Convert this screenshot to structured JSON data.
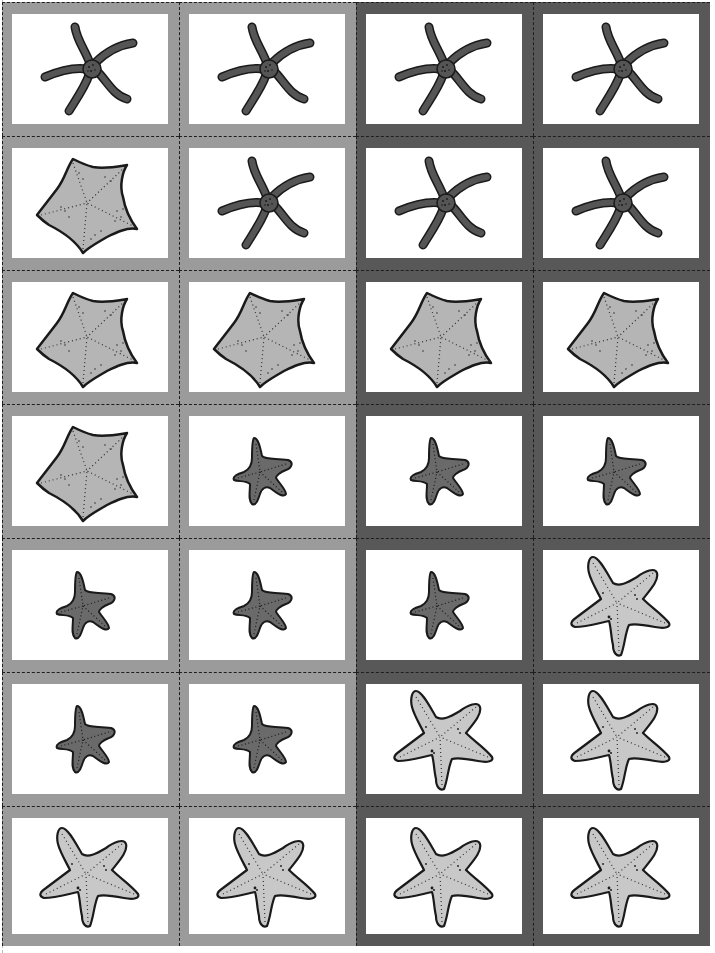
{
  "sheet": {
    "title": "Starfish matching cards",
    "columns": 4,
    "rows": 7,
    "colors": {
      "frame_light": "#9b9b9b",
      "frame_dark": "#585858",
      "card_bg": "#ffffff",
      "cut_line": "#1e1e1e",
      "brittle_fill": "#555555",
      "cushion_fill": "#b5b5b5",
      "small_fill": "#6a6a6a",
      "large_fill": "#c8c8c8"
    }
  },
  "cards": [
    {
      "row": 1,
      "col": 1,
      "frame": "light",
      "icon": "brittle-star-icon"
    },
    {
      "row": 1,
      "col": 2,
      "frame": "light",
      "icon": "brittle-star-icon"
    },
    {
      "row": 1,
      "col": 3,
      "frame": "dark",
      "icon": "brittle-star-icon"
    },
    {
      "row": 1,
      "col": 4,
      "frame": "dark",
      "icon": "brittle-star-icon"
    },
    {
      "row": 2,
      "col": 1,
      "frame": "light",
      "icon": "cushion-star-icon"
    },
    {
      "row": 2,
      "col": 2,
      "frame": "light",
      "icon": "brittle-star-icon"
    },
    {
      "row": 2,
      "col": 3,
      "frame": "dark",
      "icon": "brittle-star-icon"
    },
    {
      "row": 2,
      "col": 4,
      "frame": "dark",
      "icon": "brittle-star-icon"
    },
    {
      "row": 3,
      "col": 1,
      "frame": "light",
      "icon": "cushion-star-icon"
    },
    {
      "row": 3,
      "col": 2,
      "frame": "light",
      "icon": "cushion-star-icon"
    },
    {
      "row": 3,
      "col": 3,
      "frame": "dark",
      "icon": "cushion-star-icon"
    },
    {
      "row": 3,
      "col": 4,
      "frame": "dark",
      "icon": "cushion-star-icon"
    },
    {
      "row": 4,
      "col": 1,
      "frame": "light",
      "icon": "cushion-star-icon"
    },
    {
      "row": 4,
      "col": 2,
      "frame": "light",
      "icon": "small-starfish-icon"
    },
    {
      "row": 4,
      "col": 3,
      "frame": "dark",
      "icon": "small-starfish-icon"
    },
    {
      "row": 4,
      "col": 4,
      "frame": "dark",
      "icon": "small-starfish-icon"
    },
    {
      "row": 5,
      "col": 1,
      "frame": "light",
      "icon": "small-starfish-icon"
    },
    {
      "row": 5,
      "col": 2,
      "frame": "light",
      "icon": "small-starfish-icon"
    },
    {
      "row": 5,
      "col": 3,
      "frame": "dark",
      "icon": "small-starfish-icon"
    },
    {
      "row": 5,
      "col": 4,
      "frame": "dark",
      "icon": "large-starfish-icon"
    },
    {
      "row": 6,
      "col": 1,
      "frame": "light",
      "icon": "small-starfish-icon"
    },
    {
      "row": 6,
      "col": 2,
      "frame": "light",
      "icon": "small-starfish-icon"
    },
    {
      "row": 6,
      "col": 3,
      "frame": "dark",
      "icon": "large-starfish-icon"
    },
    {
      "row": 6,
      "col": 4,
      "frame": "dark",
      "icon": "large-starfish-icon"
    },
    {
      "row": 7,
      "col": 1,
      "frame": "light",
      "icon": "large-starfish-icon"
    },
    {
      "row": 7,
      "col": 2,
      "frame": "light",
      "icon": "large-starfish-icon"
    },
    {
      "row": 7,
      "col": 3,
      "frame": "dark",
      "icon": "large-starfish-icon"
    },
    {
      "row": 7,
      "col": 4,
      "frame": "dark",
      "icon": "large-starfish-icon"
    }
  ]
}
